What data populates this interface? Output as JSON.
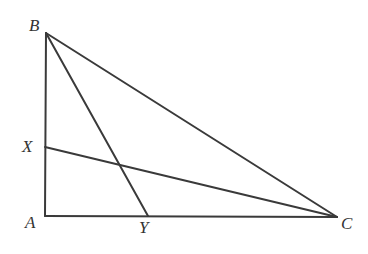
{
  "figure": {
    "kind": "geometry-diagram",
    "background_color": "#ffffff",
    "stroke_color": "#3a3a3a",
    "label_color": "#333333",
    "stroke_width": 2,
    "canvas": {
      "width": 368,
      "height": 254
    },
    "points": {
      "A": {
        "label": "A",
        "x": 45,
        "y": 216,
        "label_x": 25,
        "label_y": 214
      },
      "B": {
        "label": "B",
        "x": 46,
        "y": 33,
        "label_x": 29,
        "label_y": 17
      },
      "C": {
        "label": "C",
        "x": 337,
        "y": 217,
        "label_x": 341,
        "label_y": 215
      },
      "X": {
        "label": "X",
        "x": 45,
        "y": 147,
        "label_x": 22,
        "label_y": 138
      },
      "Y": {
        "label": "Y",
        "x": 148,
        "y": 216,
        "label_x": 139,
        "label_y": 219
      }
    },
    "segments": [
      {
        "name": "side-AB",
        "from": "A",
        "to": "B"
      },
      {
        "name": "side-AC",
        "from": "A",
        "to": "C"
      },
      {
        "name": "side-BC",
        "from": "B",
        "to": "C"
      },
      {
        "name": "cevian-BY",
        "from": "B",
        "to": "Y"
      },
      {
        "name": "cevian-XC",
        "from": "X",
        "to": "C"
      }
    ],
    "intersections": [
      {
        "name": "BY-XC-crossing",
        "x": 120,
        "y": 168
      }
    ]
  }
}
